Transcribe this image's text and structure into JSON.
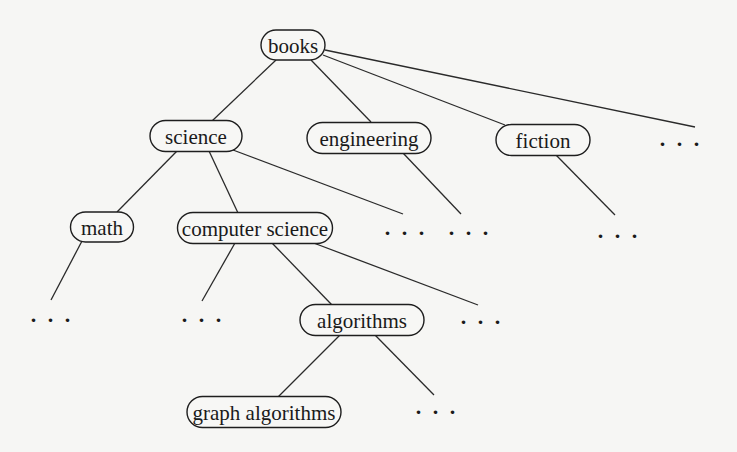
{
  "diagram": {
    "type": "tree",
    "title": "",
    "nodes": [
      {
        "id": "books",
        "label": "books",
        "cx": 293,
        "cy": 45,
        "w": 64,
        "h": 30
      },
      {
        "id": "science",
        "label": "science",
        "cx": 196,
        "cy": 136,
        "w": 92,
        "h": 31
      },
      {
        "id": "engineering",
        "label": "engineering",
        "cx": 369,
        "cy": 138,
        "w": 124,
        "h": 31
      },
      {
        "id": "fiction",
        "label": "fiction",
        "cx": 543,
        "cy": 140,
        "w": 94,
        "h": 31
      },
      {
        "id": "math",
        "label": "math",
        "cx": 102,
        "cy": 227,
        "w": 63,
        "h": 30
      },
      {
        "id": "computer_science",
        "label": "computer science",
        "cx": 255,
        "cy": 228,
        "w": 155,
        "h": 31
      },
      {
        "id": "algorithms",
        "label": "algorithms",
        "cx": 362,
        "cy": 320,
        "w": 124,
        "h": 31
      },
      {
        "id": "graph_algorithms",
        "label": "graph algorithms",
        "cx": 264,
        "cy": 412,
        "w": 154,
        "h": 31
      }
    ],
    "ellipses": [
      {
        "id": "books_more",
        "label": "...",
        "x": 681,
        "y": 146
      },
      {
        "id": "science_more",
        "label": "...",
        "x": 406,
        "y": 235
      },
      {
        "id": "engineering_more",
        "label": "...",
        "x": 470,
        "y": 235
      },
      {
        "id": "fiction_more",
        "label": "...",
        "x": 619,
        "y": 238
      },
      {
        "id": "math_more",
        "label": "...",
        "x": 52,
        "y": 322
      },
      {
        "id": "cs_more_left",
        "label": "...",
        "x": 203,
        "y": 322
      },
      {
        "id": "cs_more_right",
        "label": "...",
        "x": 482,
        "y": 324
      },
      {
        "id": "algorithms_more",
        "label": "...",
        "x": 437,
        "y": 414
      }
    ],
    "edges": [
      {
        "from": "books",
        "to": "science",
        "x1": 276,
        "y1": 60,
        "x2": 212,
        "y2": 121
      },
      {
        "from": "books",
        "to": "engineering",
        "x1": 311,
        "y1": 60,
        "x2": 371,
        "y2": 122
      },
      {
        "from": "books",
        "to": "fiction",
        "x1": 323,
        "y1": 55,
        "x2": 505,
        "y2": 125
      },
      {
        "from": "books",
        "to": "books_more",
        "x1": 325,
        "y1": 50,
        "x2": 695,
        "y2": 127
      },
      {
        "from": "science",
        "to": "math",
        "x1": 177,
        "y1": 151,
        "x2": 117,
        "y2": 212
      },
      {
        "from": "science",
        "to": "computer_science",
        "x1": 209,
        "y1": 151,
        "x2": 238,
        "y2": 213
      },
      {
        "from": "science",
        "to": "science_more",
        "x1": 233,
        "y1": 150,
        "x2": 403,
        "y2": 214
      },
      {
        "from": "engineering",
        "to": "engineering_more",
        "x1": 403,
        "y1": 153,
        "x2": 461,
        "y2": 214
      },
      {
        "from": "fiction",
        "to": "fiction_more",
        "x1": 556,
        "y1": 155,
        "x2": 615,
        "y2": 215
      },
      {
        "from": "math",
        "to": "math_more",
        "x1": 82,
        "y1": 241,
        "x2": 51,
        "y2": 300
      },
      {
        "from": "computer_science",
        "to": "cs_more_left",
        "x1": 235,
        "y1": 243,
        "x2": 202,
        "y2": 301
      },
      {
        "from": "computer_science",
        "to": "algorithms",
        "x1": 272,
        "y1": 243,
        "x2": 332,
        "y2": 305
      },
      {
        "from": "computer_science",
        "to": "cs_more_right",
        "x1": 311,
        "y1": 242,
        "x2": 478,
        "y2": 305
      },
      {
        "from": "algorithms",
        "to": "graph_algorithms",
        "x1": 340,
        "y1": 335,
        "x2": 278,
        "y2": 397
      },
      {
        "from": "algorithms",
        "to": "algorithms_more",
        "x1": 375,
        "y1": 335,
        "x2": 434,
        "y2": 395
      }
    ]
  },
  "background_text": {
    "note": "faint bleed-through text from reverse page, illegible"
  }
}
